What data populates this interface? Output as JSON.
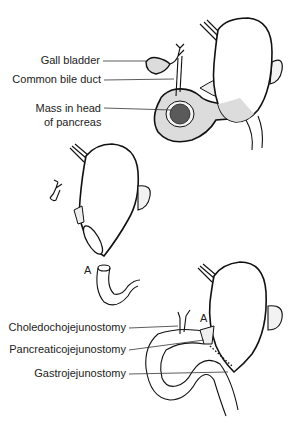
{
  "figure": {
    "panels": [
      {
        "id": "preoperative",
        "labels": [
          {
            "text": "Gall bladder"
          },
          {
            "text": "Common bile duct"
          },
          {
            "text": "Mass in head",
            "line2": "of pancreas"
          }
        ]
      },
      {
        "id": "resection",
        "labels": [
          {
            "text": "A"
          }
        ]
      },
      {
        "id": "reconstruction",
        "labels": [
          {
            "text": "Choledochojejunostomy"
          },
          {
            "text": "Pancreaticojejunostomy"
          },
          {
            "text": "Gastrojejunostomy"
          },
          {
            "text": "A"
          }
        ]
      }
    ],
    "colors": {
      "line": "#111111",
      "shading": "#d9d9d9",
      "mass": "#555555",
      "label": "#222222"
    }
  }
}
